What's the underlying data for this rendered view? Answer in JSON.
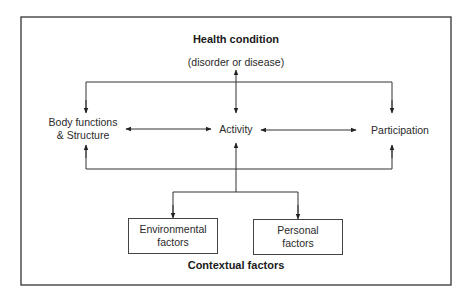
{
  "diagram": {
    "title": "Health condition",
    "subtitle": "(disorder or disease)",
    "nodes": {
      "body": {
        "line1": "Body functions",
        "line2": "& Structure"
      },
      "activity": "Activity",
      "participation": "Participation",
      "environmental": {
        "line1": "Environmental",
        "line2": "factors"
      },
      "personal": {
        "line1": "Personal",
        "line2": "factors"
      }
    },
    "footer": "Contextual factors",
    "colors": {
      "line": "#333333",
      "border": "#333333",
      "text": "#2a2a2a"
    }
  }
}
